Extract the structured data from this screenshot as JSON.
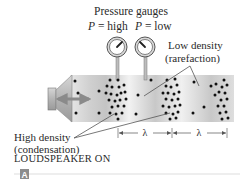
{
  "title": "Pressure gauges",
  "gauges": [
    {
      "label_var": "P",
      "label_eq": " = high",
      "pointer_angle": 40
    },
    {
      "label_var": "P",
      "label_eq": " = low",
      "pointer_angle": -45
    }
  ],
  "labels": {
    "low_density_line1": "Low density",
    "low_density_line2": "(rarefaction)",
    "high_density_line1": "High density",
    "high_density_line2": "(condensation)",
    "wavelength_symbol": "λ",
    "caption": "LOUDSPEAKER ON",
    "panel_badge": "A"
  },
  "colors": {
    "tube_light": "#f2f2f2",
    "tube_dark": "#cfcfcf",
    "speaker": "#a8a8a8",
    "arrow": "#8a8a8a",
    "dot": "#111111",
    "text": "#2a2a2a",
    "badge": "#8c8c8c"
  },
  "particles": [
    [
      75,
      81
    ],
    [
      78,
      93
    ],
    [
      76,
      113
    ],
    [
      99,
      91
    ],
    [
      99,
      113
    ],
    [
      110,
      80
    ],
    [
      118,
      80
    ],
    [
      107,
      86
    ],
    [
      112,
      87
    ],
    [
      119,
      87
    ],
    [
      124,
      85
    ],
    [
      106,
      93
    ],
    [
      111,
      94
    ],
    [
      117,
      95
    ],
    [
      121,
      93
    ],
    [
      125,
      92
    ],
    [
      109,
      100
    ],
    [
      115,
      101
    ],
    [
      120,
      100
    ],
    [
      126,
      99
    ],
    [
      112,
      107
    ],
    [
      118,
      106
    ],
    [
      124,
      106
    ],
    [
      110,
      113
    ],
    [
      116,
      114
    ],
    [
      122,
      113
    ],
    [
      118,
      119
    ],
    [
      138,
      95
    ],
    [
      136,
      114
    ],
    [
      151,
      80
    ],
    [
      167,
      80
    ],
    [
      175,
      79
    ],
    [
      166,
      86
    ],
    [
      171,
      87
    ],
    [
      177,
      85
    ],
    [
      163,
      93
    ],
    [
      168,
      93
    ],
    [
      174,
      94
    ],
    [
      179,
      92
    ],
    [
      166,
      99
    ],
    [
      172,
      100
    ],
    [
      178,
      99
    ],
    [
      163,
      106
    ],
    [
      169,
      107
    ],
    [
      175,
      106
    ],
    [
      180,
      105
    ],
    [
      166,
      113
    ],
    [
      173,
      114
    ],
    [
      178,
      112
    ],
    [
      170,
      119
    ],
    [
      176,
      118
    ],
    [
      194,
      82
    ],
    [
      193,
      113
    ],
    [
      204,
      107
    ],
    [
      211,
      86
    ],
    [
      224,
      80
    ],
    [
      216,
      84
    ],
    [
      222,
      87
    ],
    [
      227,
      85
    ],
    [
      219,
      92
    ],
    [
      225,
      93
    ],
    [
      221,
      100
    ],
    [
      227,
      99
    ],
    [
      218,
      106
    ],
    [
      224,
      106
    ],
    [
      220,
      113
    ],
    [
      226,
      112
    ],
    [
      222,
      119
    ],
    [
      228,
      118
    ],
    [
      215,
      95
    ]
  ]
}
